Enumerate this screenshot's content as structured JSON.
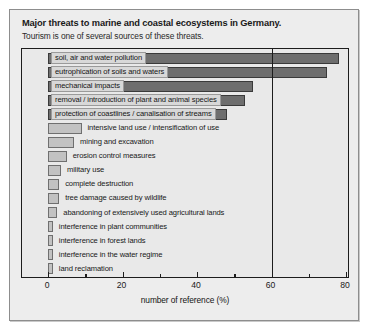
{
  "caption": {
    "title": "Major threats to marine and coastal ecosystems in Germany.",
    "subtitle": "Tourism is one of several sources of these threats."
  },
  "chart_data": {
    "type": "bar",
    "orientation": "horizontal",
    "title": "Major threats to marine and coastal ecosystems in Germany.",
    "subtitle": "Tourism is one of several sources of these threats.",
    "xlabel": "number of reference (%)",
    "ylabel": "",
    "xlim": [
      0,
      80
    ],
    "xticks": [
      0,
      20,
      40,
      60,
      80
    ],
    "xticklabels": [
      "0",
      "20",
      "40",
      "60",
      "80"
    ],
    "xminorticks": [
      10,
      30,
      50,
      70
    ],
    "grid": false,
    "gridlines_vertical": [
      60
    ],
    "legend": "none",
    "categories": [
      "soil, air and water pollution",
      "eutrophication of soils and waters",
      "mechanical impacts",
      "removal / introduction of plant and animal species",
      "protection of coastlines / canalisation of streams",
      "intensive land use / intensification of use",
      "mining and excavation",
      "erosion control measures",
      "military use",
      "complete destruction",
      "tree damage caused by wildlife",
      "abandoning of extensively used agricultural lands",
      "interference in plant communities",
      "interference in forest lands",
      "interference in the water regime",
      "land reclamation"
    ],
    "values": [
      78,
      75,
      55,
      53,
      48,
      9,
      7,
      5,
      3.5,
      3,
      3,
      2.5,
      1.3,
      1.3,
      1.3,
      1.3
    ],
    "colors": {
      "highlighted_bar": "#6e6e6e",
      "standard_bar": "#c2c2c2",
      "axis": "#1d1d1d",
      "background": "#e9e9e9",
      "label_box": "#d8d8d8"
    },
    "label_placement": [
      "inside",
      "inside",
      "inside",
      "inside",
      "inside",
      "outside",
      "outside",
      "outside",
      "outside",
      "outside",
      "outside",
      "outside",
      "outside",
      "outside",
      "outside",
      "outside"
    ]
  }
}
